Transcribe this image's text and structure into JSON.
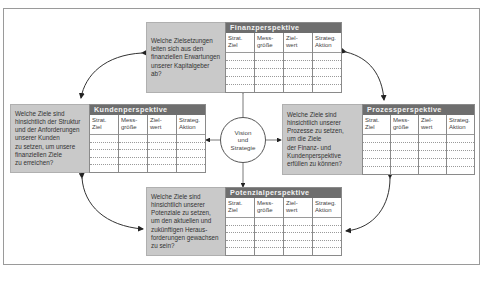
{
  "diagram": {
    "center": {
      "label": "Vision\nund\nStrategie"
    },
    "column_headers": [
      "Strat.\nZiel",
      "Mess-\ngröße",
      "Ziel-\nwert",
      "Strateg.\nAktion"
    ],
    "perspectives": [
      {
        "id": "finanz",
        "title": "Finanzperspektive",
        "question": "Welche Zielsetzungen\nleiten sich aus den\nfinanziellen Erwartungen\nunserer Kapitalgeber ab?"
      },
      {
        "id": "kunden",
        "title": "Kundenperspektive",
        "question": "Welche Ziele sind\nhinsichtlich der Struktur\nund der Anforderungen\nunserer Kunden\nzu setzen, um unsere\nfinanziellen Ziele\nzu erreichen?"
      },
      {
        "id": "prozess",
        "title": "Prozessperspektive",
        "question": "Welche Ziele sind\nhinsichtlich unserer\nProzesse zu setzen,\num die Ziele\nder Finanz- und\nKundenperspektive\nerfüllen zu können?"
      },
      {
        "id": "potenzial",
        "title": "Potenzialperspektive",
        "question": "Welche Ziele sind\nhinsichtlich unserer\nPotenziale zu setzen,\num den aktuellen und\nzukünftigen Heraus-\nforderungen gewachsen\nzu sein?"
      }
    ],
    "colors": {
      "header_bg": "#6e6e6e",
      "question_bg": "#c9c9c9",
      "frame": "#9a9a9a"
    }
  }
}
